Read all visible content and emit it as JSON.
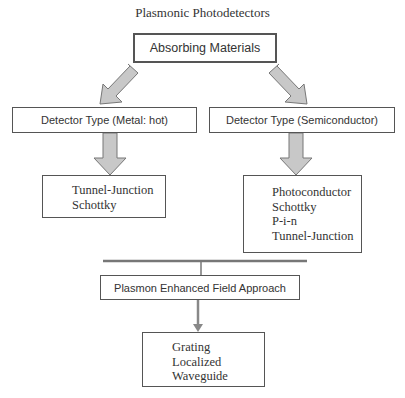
{
  "title": "Plasmonic Photodetectors",
  "root": {
    "label": "Absorbing Materials"
  },
  "detector_types": [
    {
      "label": "Detector Type (Metal: hot)",
      "items": [
        "Tunnel-Junction",
        "Schottky"
      ]
    },
    {
      "label": "Detector Type (Semiconductor)",
      "items": [
        "Photoconductor",
        "Schottky",
        "P-i-n",
        "Tunnel-Junction"
      ]
    }
  ],
  "approach": {
    "label": "Plasmon Enhanced Field Approach",
    "items": [
      "Grating",
      "Localized",
      "Waveguide"
    ]
  },
  "colors": {
    "border": "#555555",
    "arrow_fill": "#c8c8c8",
    "arrow_stroke": "#777777",
    "text": "#333333"
  }
}
